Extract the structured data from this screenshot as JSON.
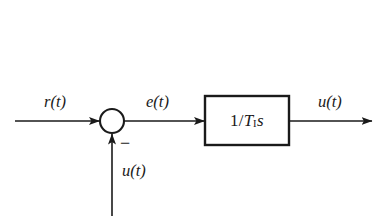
{
  "figure": {
    "kind": "control-system-block-diagram",
    "background_color": "#ffffff",
    "stroke_color": "#1a1a1a"
  },
  "labels": {
    "reference_input": "r(t)",
    "error_signal": "e(t)",
    "feedback_signal": "u(t)",
    "output_signal": "u(t)",
    "summing_sign": "−"
  },
  "block": {
    "transfer_function_display": "1/T₁s",
    "numerator": "1",
    "divider": "/",
    "gain_symbol": "T",
    "gain_subscript": "I",
    "laplace_variable": "s"
  },
  "nodes": [
    {
      "name": "summing-junction",
      "shape": "circle",
      "cx": 112,
      "cy": 121,
      "r": 12
    },
    {
      "name": "transfer-function-block",
      "shape": "rectangle",
      "x": 205,
      "y": 96,
      "width": 84,
      "height": 49
    }
  ],
  "edges": [
    {
      "name": "reference-input-arrow",
      "from": "left-edge",
      "to": "summing-junction",
      "direction": "right"
    },
    {
      "name": "error-signal-arrow",
      "from": "summing-junction",
      "to": "transfer-function-block",
      "direction": "right"
    },
    {
      "name": "output-signal-arrow",
      "from": "transfer-function-block",
      "to": "right-edge",
      "direction": "right"
    },
    {
      "name": "feedback-arrow",
      "from": "bottom-edge",
      "to": "summing-junction",
      "direction": "up",
      "sign": "negative"
    }
  ]
}
